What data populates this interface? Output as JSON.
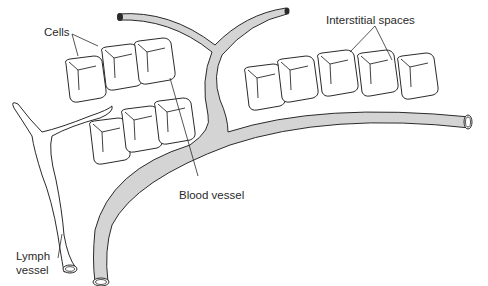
{
  "diagram": {
    "labels": {
      "cells": "Cells",
      "interstitial_spaces": "Interstitial spaces",
      "blood_vessel": "Blood vessel",
      "lymph_vessel_line1": "Lymph",
      "lymph_vessel_line2": "vessel"
    },
    "colors": {
      "background": "#ffffff",
      "outline": "#2a2a2a",
      "blood_vessel_fill": "#d4d4d4",
      "cell_fill": "#ffffff"
    }
  }
}
